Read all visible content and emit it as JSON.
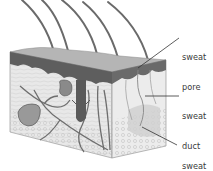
{
  "diagram": {
    "colors": {
      "background": "#ffffff",
      "epidermis_top": "#a8a8a8",
      "epidermis_dark": "#5a5a5a",
      "dermis": "#e6e6e6",
      "vessel": "#6e6e6e",
      "hair": "#707070",
      "leader_line": "#333333",
      "label_text": "#3a3a3a"
    },
    "labels": [
      {
        "id": "sweat-pore",
        "line1": "sweat",
        "line2": "pore",
        "x": 182,
        "y": 32,
        "target": [
          138,
          68
        ]
      },
      {
        "id": "sweat-duct",
        "line1": "sweat",
        "line2": "duct",
        "x": 182,
        "y": 92,
        "target": [
          145,
          96
        ]
      },
      {
        "id": "sweat-gland",
        "line1": "sweat",
        "line2": "gland",
        "x": 182,
        "y": 142,
        "target": [
          142,
          127
        ]
      }
    ]
  }
}
